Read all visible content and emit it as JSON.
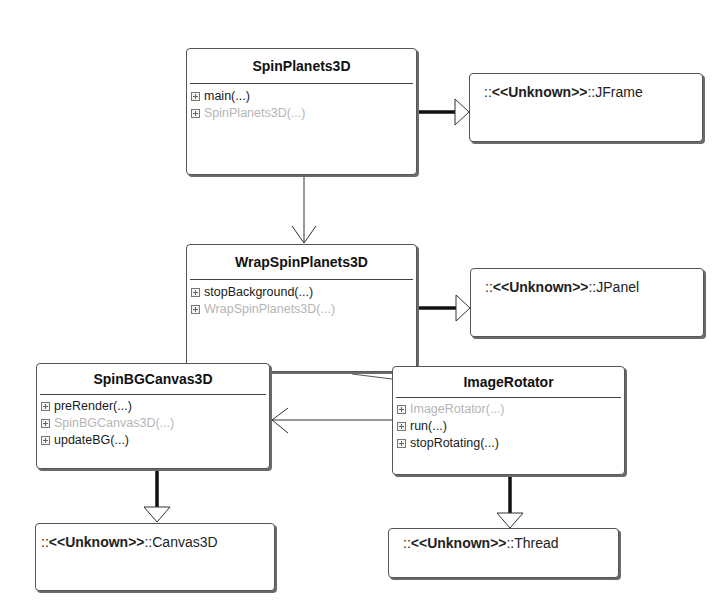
{
  "diagram": {
    "type": "UML class diagram",
    "classes": [
      {
        "name": "SpinPlanets3D",
        "operations": [
          {
            "label": "main(...)",
            "constructor": false
          },
          {
            "label": "SpinPlanets3D(...)",
            "constructor": true
          }
        ]
      },
      {
        "name": "WrapSpinPlanets3D",
        "operations": [
          {
            "label": "stopBackground(...)",
            "constructor": false
          },
          {
            "label": "WrapSpinPlanets3D(...)",
            "constructor": true
          }
        ]
      },
      {
        "name": "SpinBGCanvas3D",
        "operations": [
          {
            "label": "preRender(...)",
            "constructor": false
          },
          {
            "label": "SpinBGCanvas3D(...)",
            "constructor": true
          },
          {
            "label": "updateBG(...)",
            "constructor": false
          }
        ]
      },
      {
        "name": "ImageRotator",
        "operations": [
          {
            "label": "ImageRotator(...)",
            "constructor": true
          },
          {
            "label": "run(...)",
            "constructor": false
          },
          {
            "label": "stopRotating(...)",
            "constructor": false
          }
        ]
      }
    ],
    "external_classes": [
      {
        "prefix": "::",
        "stereotype": "<<Unknown>>",
        "suffix": "::JFrame"
      },
      {
        "prefix": "::",
        "stereotype": "<<Unknown>>",
        "suffix": "::JPanel"
      },
      {
        "prefix": "::",
        "stereotype": "<<Unknown>>",
        "suffix": "::Canvas3D"
      },
      {
        "prefix": "::",
        "stereotype": "<<Unknown>>",
        "suffix": "::Thread"
      }
    ],
    "relationships": [
      {
        "from": "SpinPlanets3D",
        "to": "JFrame",
        "kind": "generalization"
      },
      {
        "from": "SpinPlanets3D",
        "to": "WrapSpinPlanets3D",
        "kind": "association"
      },
      {
        "from": "WrapSpinPlanets3D",
        "to": "JPanel",
        "kind": "generalization"
      },
      {
        "from": "WrapSpinPlanets3D",
        "to": "ImageRotator",
        "kind": "association"
      },
      {
        "from": "ImageRotator",
        "to": "SpinBGCanvas3D",
        "kind": "association"
      },
      {
        "from": "SpinBGCanvas3D",
        "to": "Canvas3D",
        "kind": "generalization"
      },
      {
        "from": "ImageRotator",
        "to": "Thread",
        "kind": "generalization"
      }
    ]
  }
}
